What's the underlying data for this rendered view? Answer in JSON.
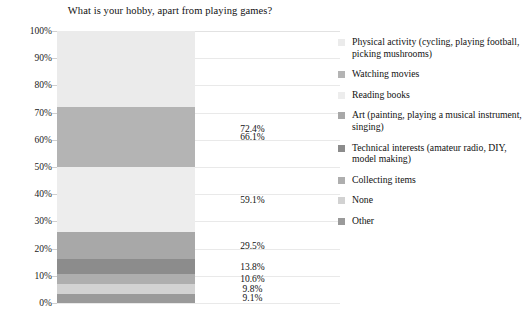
{
  "chart_data": {
    "type": "bar",
    "subtype": "stacked-bar-single-category",
    "title": "What is your hobby, apart from playing games?",
    "xlabel": "",
    "ylabel": "",
    "ylim": [
      0,
      100
    ],
    "grid": true,
    "legend_position": "right",
    "value_suffix": "%",
    "categories": [
      "Hobby"
    ],
    "axis_ticks": [
      "0%",
      "10%",
      "20%",
      "30%",
      "40%",
      "50%",
      "60%",
      "70%",
      "80%",
      "90%",
      "100%"
    ],
    "axis_tick_values": [
      0,
      10,
      20,
      30,
      40,
      50,
      60,
      70,
      80,
      90,
      100
    ],
    "series": [
      {
        "name": "Physical activity (cycling, playing football, picking mushrooms)",
        "value": 72.4,
        "label": "72.4%",
        "color": "#ebebeb",
        "stack_from": 27.6,
        "stack_to": 100.0
      },
      {
        "name": "Watching movies",
        "value": 66.1,
        "label": "66.1%",
        "color": "#b4b4b4",
        "stack_from": 50.0,
        "stack_to": 72.0
      },
      {
        "name": "Reading books",
        "value": 59.1,
        "label": "59.1%",
        "color": "#ededed",
        "stack_from": 26.0,
        "stack_to": 50.0
      },
      {
        "name": "Art (painting, playing a musical instrument, singing)",
        "value": 29.5,
        "label": "29.5%",
        "color": "#a8a8a8",
        "stack_from": 16.2,
        "stack_to": 26.0
      },
      {
        "name": "Technical interests (amateur radio, DIY, model making)",
        "value": 13.8,
        "label": "13.8%",
        "color": "#8c8c8c",
        "stack_from": 10.6,
        "stack_to": 16.2
      },
      {
        "name": "Collecting items",
        "value": 10.6,
        "label": "10.6%",
        "color": "#aeaeae",
        "stack_from": 7.0,
        "stack_to": 10.6
      },
      {
        "name": "None",
        "value": 9.8,
        "label": "9.8%",
        "color": "#d2d2d2",
        "stack_from": 3.4,
        "stack_to": 7.0
      },
      {
        "name": "Other",
        "value": 9.1,
        "label": "9.1%",
        "color": "#9a9a9a",
        "stack_from": 0.0,
        "stack_to": 3.4
      }
    ]
  },
  "colors": {
    "background": "#ffffff",
    "gridline": "#e9e9e9",
    "text": "#111111",
    "tickmark": "#cfcfcf"
  }
}
